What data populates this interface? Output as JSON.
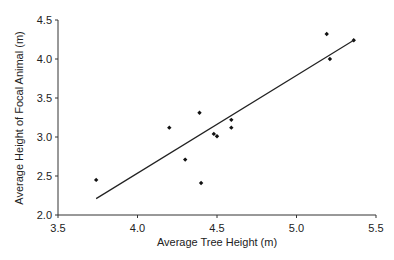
{
  "chart_data": {
    "type": "scatter",
    "title": "",
    "xlabel": "Average Tree Height (m)",
    "ylabel": "Average Height of Focal Animal (m)",
    "xlim": [
      3.5,
      5.5
    ],
    "ylim": [
      2.0,
      4.5
    ],
    "xticks": [
      "3.5",
      "4.0",
      "4.5",
      "5.0",
      "5.5"
    ],
    "yticks": [
      "2.0",
      "2.5",
      "3.0",
      "3.5",
      "4.0",
      "4.5"
    ],
    "grid": false,
    "legend": null,
    "series": [
      {
        "name": "observations",
        "points": [
          {
            "x": 3.74,
            "y": 2.45
          },
          {
            "x": 4.2,
            "y": 3.12
          },
          {
            "x": 4.3,
            "y": 2.71
          },
          {
            "x": 4.39,
            "y": 3.31
          },
          {
            "x": 4.4,
            "y": 2.41
          },
          {
            "x": 4.48,
            "y": 3.04
          },
          {
            "x": 4.5,
            "y": 3.01
          },
          {
            "x": 4.59,
            "y": 3.22
          },
          {
            "x": 4.59,
            "y": 3.12
          },
          {
            "x": 5.19,
            "y": 4.32
          },
          {
            "x": 5.21,
            "y": 4.0
          },
          {
            "x": 5.36,
            "y": 4.24
          }
        ]
      }
    ],
    "trendline": {
      "type": "linear",
      "x": [
        3.74,
        5.36
      ],
      "y": [
        2.21,
        4.24
      ]
    }
  }
}
